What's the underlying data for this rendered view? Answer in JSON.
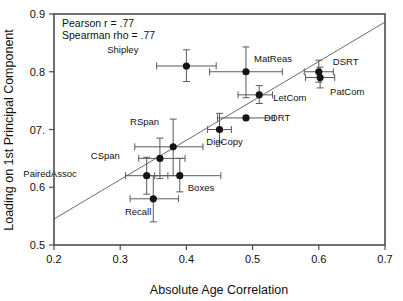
{
  "chart_data": {
    "type": "scatter",
    "title": "",
    "xlabel": "Absolute Age Correlation",
    "ylabel": "Loading on 1st Principal Component",
    "xlim": [
      0.2,
      0.7
    ],
    "ylim": [
      0.5,
      0.9
    ],
    "xticks": [
      0.2,
      0.3,
      0.4,
      0.5,
      0.6,
      0.7
    ],
    "xtick_labels": [
      "0.2",
      "0.3",
      "0.4",
      "0.5",
      "0.6",
      "0.7"
    ],
    "yticks": [
      0.5,
      0.6,
      0.7,
      0.8,
      0.9
    ],
    "ytick_labels": [
      "0.5",
      "0.6",
      "07.",
      "0.8",
      "0.9"
    ],
    "grid": false,
    "legend": "none",
    "annotations": [
      "Pearson r = .77",
      "Spearman rho = .77"
    ],
    "fit_line": {
      "x": [
        0.2,
        0.7
      ],
      "y": [
        0.545,
        0.886
      ]
    },
    "points": [
      {
        "label": "Shipley",
        "x": 0.4,
        "y": 0.81,
        "xerr_low": 0.355,
        "xerr_high": 0.445,
        "yerr_low": 0.783,
        "yerr_high": 0.838,
        "label_dx": -48,
        "label_dy": -13
      },
      {
        "label": "MatReas",
        "x": 0.49,
        "y": 0.8,
        "xerr_low": 0.435,
        "xerr_high": 0.545,
        "yerr_low": 0.755,
        "yerr_high": 0.843,
        "label_dx": 8,
        "label_dy": -10
      },
      {
        "label": "DSRT",
        "x": 0.6,
        "y": 0.8,
        "xerr_low": 0.578,
        "xerr_high": 0.622,
        "yerr_low": 0.782,
        "yerr_high": 0.82,
        "label_dx": 14,
        "label_dy": -7
      },
      {
        "label": "PatCom",
        "x": 0.602,
        "y": 0.79,
        "xerr_low": 0.58,
        "xerr_high": 0.624,
        "yerr_low": 0.772,
        "yerr_high": 0.808,
        "label_dx": 10,
        "label_dy": 17
      },
      {
        "label": "LetCom",
        "x": 0.51,
        "y": 0.76,
        "xerr_low": 0.478,
        "xerr_high": 0.53,
        "yerr_low": 0.745,
        "yerr_high": 0.776,
        "label_dx": 14,
        "label_dy": 6
      },
      {
        "label": "DDRT",
        "x": 0.49,
        "y": 0.72,
        "xerr_low": 0.447,
        "xerr_high": 0.533,
        "yerr_low": 0.72,
        "yerr_high": 0.72,
        "label_dx": 18,
        "label_dy": 3
      },
      {
        "label": "DigCopy",
        "x": 0.45,
        "y": 0.7,
        "xerr_low": 0.432,
        "xerr_high": 0.468,
        "yerr_low": 0.678,
        "yerr_high": 0.728,
        "label_dx": 5,
        "label_dy": 15
      },
      {
        "label": "RSpan",
        "x": 0.38,
        "y": 0.67,
        "xerr_low": 0.322,
        "xerr_high": 0.425,
        "yerr_low": 0.62,
        "yerr_high": 0.718,
        "label_dx": -14,
        "label_dy": -22
      },
      {
        "label": "CSpan",
        "x": 0.36,
        "y": 0.65,
        "xerr_low": 0.328,
        "xerr_high": 0.398,
        "yerr_low": 0.615,
        "yerr_high": 0.685,
        "label_dx": -40,
        "label_dy": 1
      },
      {
        "label": "PairedAssoc",
        "x": 0.34,
        "y": 0.62,
        "xerr_low": 0.308,
        "xerr_high": 0.372,
        "yerr_low": 0.588,
        "yerr_high": 0.652,
        "label_dx": -70,
        "label_dy": 1
      },
      {
        "label": "Boxes",
        "x": 0.39,
        "y": 0.62,
        "xerr_low": 0.352,
        "xerr_high": 0.452,
        "yerr_low": 0.592,
        "yerr_high": 0.65,
        "label_dx": 8,
        "label_dy": 15
      },
      {
        "label": "Recall",
        "x": 0.35,
        "y": 0.58,
        "xerr_low": 0.315,
        "xerr_high": 0.388,
        "yerr_low": 0.54,
        "yerr_high": 0.62,
        "label_dx": -2,
        "label_dy": 16
      }
    ]
  }
}
